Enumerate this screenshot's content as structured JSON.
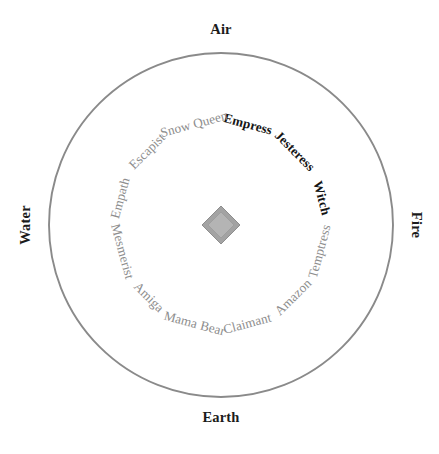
{
  "diagram": {
    "center_hub": {
      "shape": "diamond",
      "outer_color": "#a3a3a3",
      "inner_color": "#b4b4b4"
    },
    "geometry": {
      "center_x": 221,
      "center_y": 225,
      "radius": 172,
      "sector_count": 12,
      "sector_degrees": 30
    },
    "colors": {
      "circle_stroke": "#8a8a8a",
      "axis_stroke": "#8a8a8a",
      "divider_stroke": "#c9c9c9",
      "label_dark": "#141414",
      "label_gray": "#8d8d8d",
      "background": "#ffffff"
    },
    "elements": [
      {
        "label": "Air",
        "position": "top",
        "rotation": 0
      },
      {
        "label": "Fire",
        "position": "right",
        "rotation": 90
      },
      {
        "label": "Earth",
        "position": "bottom",
        "rotation": 0
      },
      {
        "label": "Water",
        "position": "left",
        "rotation": -90
      }
    ],
    "sectors": [
      {
        "label": "Empress",
        "mid_angle_deg": 15,
        "tone": "dark",
        "quadrant": "Air-Fire"
      },
      {
        "label": "Jesteress",
        "mid_angle_deg": 45,
        "tone": "dark",
        "quadrant": "Air-Fire"
      },
      {
        "label": "Witch",
        "mid_angle_deg": 75,
        "tone": "dark",
        "quadrant": "Air-Fire"
      },
      {
        "label": "Temptress",
        "mid_angle_deg": 105,
        "tone": "gray",
        "quadrant": "Fire-Earth"
      },
      {
        "label": "Amazon",
        "mid_angle_deg": 135,
        "tone": "gray",
        "quadrant": "Fire-Earth"
      },
      {
        "label": "Claimant",
        "mid_angle_deg": 165,
        "tone": "gray",
        "quadrant": "Fire-Earth"
      },
      {
        "label": "Mama Bear",
        "mid_angle_deg": 195,
        "tone": "gray",
        "quadrant": "Earth-Water"
      },
      {
        "label": "Amiga",
        "mid_angle_deg": 225,
        "tone": "gray",
        "quadrant": "Earth-Water"
      },
      {
        "label": "Mesmerist",
        "mid_angle_deg": 255,
        "tone": "gray",
        "quadrant": "Earth-Water"
      },
      {
        "label": "Empath",
        "mid_angle_deg": 285,
        "tone": "gray",
        "quadrant": "Water-Air"
      },
      {
        "label": "Escapist",
        "mid_angle_deg": 315,
        "tone": "gray",
        "quadrant": "Water-Air"
      },
      {
        "label": "Snow Queen",
        "mid_angle_deg": 345,
        "tone": "gray",
        "quadrant": "Water-Air"
      }
    ]
  }
}
